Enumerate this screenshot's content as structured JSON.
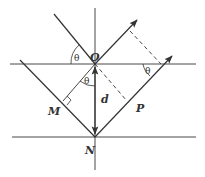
{
  "diagram": {
    "colors": {
      "line": "#333333",
      "background": "#ffffff"
    },
    "labels": {
      "O": "O",
      "N": "N",
      "M": "M",
      "P": "P",
      "d": "d"
    },
    "angles": {
      "incident": "θ",
      "refracted": "θ",
      "exit": "θ"
    }
  }
}
